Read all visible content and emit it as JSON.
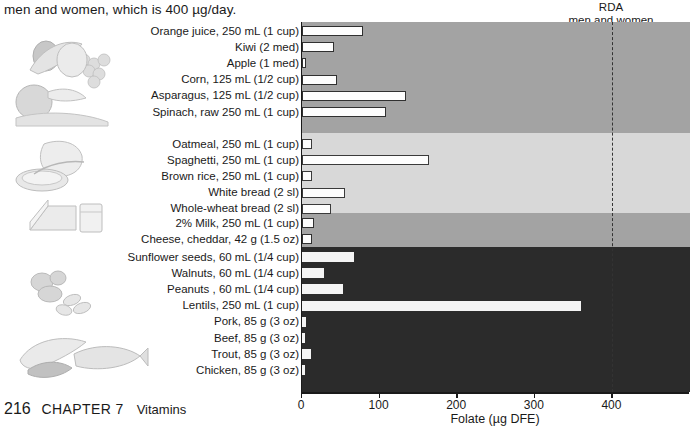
{
  "caption": "men and women, which is 400 µg/day.",
  "footer": {
    "page_number": "216",
    "chapter": "CHAPTER 7",
    "section": "Vitamins"
  },
  "annotation": {
    "rda_line_1": "RDA",
    "rda_line_2": "men and women",
    "rda_value": 400
  },
  "axis": {
    "title": "Folate (µg DFE)",
    "ticks": [
      0,
      100,
      200,
      300,
      400
    ],
    "min": 0,
    "max": 500
  },
  "colors": {
    "band_fruit_veg": "#a3a3a3",
    "band_grain": "#d8d8d8",
    "band_dairy": "#a3a3a3",
    "band_protein": "#2b2b2b",
    "bar_fill": "#fdfdfd",
    "bar_stroke": "#303030",
    "axis": "#1a1a1a",
    "rda_line": "#333333"
  },
  "chart_data": {
    "type": "bar",
    "orientation": "horizontal",
    "title": "",
    "xlabel": "Folate (µg DFE)",
    "ylabel": "",
    "xlim": [
      0,
      500
    ],
    "grid": false,
    "legend": "none",
    "annotations": [
      {
        "label": "RDA men and women",
        "value": 400,
        "style": "dashed-vertical"
      }
    ],
    "groups": [
      {
        "name": "Fruits and Vegetables",
        "band_color": "#a3a3a3",
        "categories": [
          "Orange juice, 250 mL (1 cup)",
          "Kiwi (2 med)",
          "Apple (1 med)",
          "Corn, 125 mL (1/2 cup)",
          "Asparagus, 125 mL (1/2 cup)",
          "Spinach, raw 250 mL (1 cup)"
        ],
        "values": [
          79,
          41,
          5,
          45,
          134,
          108
        ]
      },
      {
        "name": "Grains",
        "band_color": "#d8d8d8",
        "categories": [
          "Oatmeal, 250 mL (1 cup)",
          "Spaghetti, 250 mL (1 cup)",
          "Brown rice, 250 mL (1 cup)",
          "White bread (2 sl)",
          "Whole-wheat bread (2 sl)"
        ],
        "values": [
          13,
          164,
          13,
          56,
          38
        ]
      },
      {
        "name": "Dairy",
        "band_color": "#a3a3a3",
        "categories": [
          "2% Milk, 250 mL (1 cup)",
          "Cheese, cheddar, 42 g (1.5 oz)"
        ],
        "values": [
          15,
          13
        ]
      },
      {
        "name": "Protein Foods",
        "band_color": "#2b2b2b",
        "categories": [
          "Sunflower seeds, 60 mL (1/4 cup)",
          "Walnuts, 60 mL (1/4 cup)",
          "Peanuts , 60 mL (1/4 cup)",
          "Lentils, 250 mL (1 cup)",
          "Pork, 85 g (3 oz)",
          "Beef, 85 g (3 oz)",
          "Trout, 85 g (3 oz)",
          "Chicken, 85 g (3 oz)"
        ],
        "values": [
          67,
          28,
          53,
          360,
          5,
          4,
          12,
          3
        ]
      }
    ]
  }
}
